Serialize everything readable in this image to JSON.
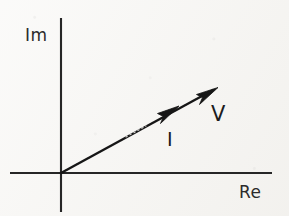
{
  "figure": {
    "kind": "phasor-diagram",
    "background_color": "#f6f5f2",
    "ink_color": "#1c1c1c",
    "width": 289,
    "height": 216
  },
  "axes": {
    "origin": {
      "x": 61,
      "y": 173
    },
    "imaginary": {
      "label": "Im",
      "label_position": {
        "x": 25,
        "y": 27
      },
      "x": 61,
      "y_top": 18,
      "y_bottom": 212
    },
    "real": {
      "label": "Re",
      "label_position": {
        "x": 239,
        "y": 184
      },
      "y": 173,
      "x_left": 10,
      "x_right": 272
    }
  },
  "phasors": [
    {
      "label": "V",
      "name": "voltage-phasor",
      "tip": {
        "x": 218,
        "y": 88
      },
      "angle_degrees": 28,
      "label_position": {
        "x": 211,
        "y": 104
      }
    },
    {
      "label": "I",
      "name": "current-phasor",
      "tip": {
        "x": 178,
        "y": 107
      },
      "angle_degrees": 28,
      "label_position": {
        "x": 167,
        "y": 130
      }
    }
  ],
  "notes": {
    "relation": "V and I are collinear (in phase), I shorter than V"
  }
}
